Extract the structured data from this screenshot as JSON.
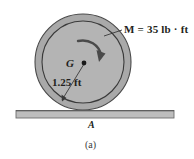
{
  "figure": {
    "caption": "(a)",
    "background_color": "#ffffff",
    "ink_color": "#231f20",
    "body": {
      "shape": "disk",
      "name": "wheel",
      "outer_ring_fill": "#a8a8a8",
      "inner_disk_fill": "#b5b5b5",
      "outline_color": "#3b3b3b",
      "center_point_name": "G",
      "center_label": "G",
      "radius_label": "1.25 ft",
      "radius_value": 1.25,
      "radius_units": "ft"
    },
    "applied_moment": {
      "symbol": "M",
      "equals": "=",
      "magnitude": "35",
      "units": "lb · ft",
      "full_label": "M = 35 lb · ft",
      "sense": "clockwise"
    },
    "ground": {
      "contact_point_label": "A",
      "surface_fill": "#bdbdbd",
      "surface_edge": "#6e6e6e"
    }
  }
}
